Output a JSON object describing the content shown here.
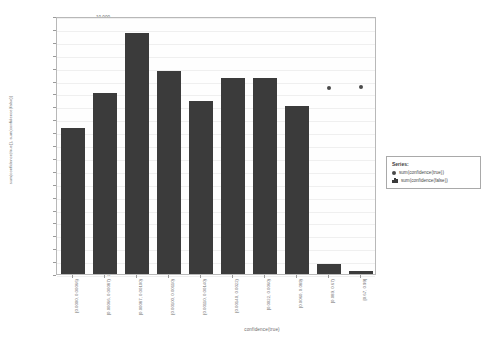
{
  "chart_data": {
    "type": "bar",
    "title": "",
    "xlabel": "confidence(true)",
    "ylabel": "sum(confidence(true)), sum(confidence(false))",
    "ylim": [
      0,
      10000
    ],
    "ytick_step": 500,
    "grid": true,
    "legend_position": "right",
    "legend_title": "Series:",
    "categories": [
      "[0.0000, 0.00066)",
      "[0.00066, 0.00087)",
      "[0.00087, 0.00100)",
      "[0.00100, 0.00110)",
      "[0.00110, 0.00140)",
      "[0.00140, 0.0022)",
      "[0.0022, 0.0060)",
      "[0.0060, 0.089)",
      "[0.089, 0.67)",
      "[0.67, 0.99]"
    ],
    "ytick_labels": [
      "10,000",
      "9,500",
      "9,000",
      "8,500",
      "8,000",
      "7,500",
      "7,000",
      "6,500",
      "6,000",
      "5,500",
      "5,000",
      "4,500",
      "4,000",
      "3,500",
      "3,000",
      "2,500",
      "2,000",
      "1,500",
      "1,000",
      "500",
      "0"
    ],
    "series": [
      {
        "name": "sum(confidence(false))",
        "marker": "bar",
        "color": "#3b3b3b",
        "values": [
          5650,
          7000,
          9350,
          7850,
          6700,
          7600,
          7600,
          6500,
          400,
          130
        ]
      },
      {
        "name": "sum(confidence(true))",
        "marker": "dot",
        "color": "#4a4a4a",
        "values": [
          null,
          null,
          null,
          null,
          null,
          null,
          null,
          null,
          7200,
          7250
        ]
      }
    ]
  },
  "legend": {
    "title": "Series:",
    "entries": [
      {
        "label": "sum(confidence(true))",
        "marker": "dot"
      },
      {
        "label": "sum(confidence(false))",
        "marker": "bar"
      }
    ]
  },
  "axes": {
    "x_title": "confidence(true)",
    "y_title": "sum(confidence(true)), sum(confidence(false))"
  }
}
